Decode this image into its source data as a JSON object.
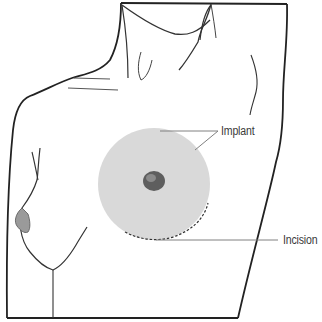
{
  "diagram": {
    "labels": [
      {
        "id": "implant",
        "text": "Implant"
      },
      {
        "id": "incision",
        "text": "Incision"
      }
    ],
    "colors": {
      "outline": "#222222",
      "implant_fill": "#d9d9d9",
      "leader_line": "#808080",
      "label_text": "#3a3a3a",
      "nipple": "#6a6a6a"
    }
  }
}
